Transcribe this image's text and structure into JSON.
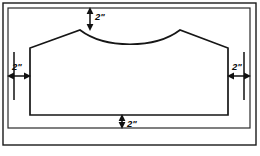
{
  "drawing": {
    "title": "Dimensioned cutout layout drawing",
    "units": "inches",
    "stroke_color": "#161616",
    "frame_color": "#1a1a1a",
    "background_color": "#ffffff",
    "frame": {
      "outer": {
        "x": 3,
        "y": 3,
        "width": 253,
        "height": 142
      },
      "inner": {
        "x": 8,
        "y": 8,
        "width": 242,
        "height": 120
      }
    },
    "workpiece": {
      "name": "cutout-outline",
      "left_edge_x": 30,
      "right_edge_x": 228,
      "bottom_edge_y": 115,
      "shoulder_y": 48,
      "peak_y": 30,
      "left_peak_x": 80,
      "right_peak_x": 180,
      "curve_low_y": 44,
      "path": "M 30 115 L 30 48 L 80 30 C 105 49, 155 49, 180 30 L 228 48 L 228 115 Z"
    },
    "dimensions": [
      {
        "id": "top",
        "label": "2\"",
        "orientation": "vertical",
        "axis_x": 90,
        "from_y": 8,
        "to_y": 30,
        "label_x": 95,
        "label_y": 20,
        "measures": "frame-top-to-peak"
      },
      {
        "id": "left",
        "label": "2\"",
        "orientation": "horizontal",
        "axis_y": 76,
        "from_x": 8,
        "to_x": 30,
        "label_x": 12,
        "label_y": 70,
        "measures": "frame-left-to-workpiece-left"
      },
      {
        "id": "right",
        "label": "2\"",
        "orientation": "horizontal",
        "axis_y": 76,
        "from_x": 228,
        "to_x": 250,
        "label_x": 234,
        "label_y": 70,
        "measures": "workpiece-right-to-frame-right"
      },
      {
        "id": "bottom",
        "label": "2\"",
        "orientation": "vertical",
        "axis_x": 122,
        "from_y": 115,
        "to_y": 128,
        "label_x": 127,
        "label_y": 127,
        "measures": "workpiece-bottom-to-frame-bottom"
      }
    ],
    "extension_lines": [
      {
        "id": "left-frame-ext",
        "x1": 14,
        "y1": 52,
        "x2": 14,
        "y2": 100
      },
      {
        "id": "right-frame-ext",
        "x1": 244,
        "y1": 52,
        "x2": 244,
        "y2": 100
      }
    ]
  }
}
